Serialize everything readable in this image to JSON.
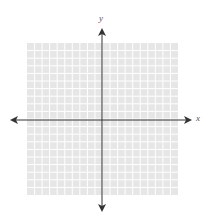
{
  "diagram": {
    "type": "coordinate-plane",
    "axes": {
      "x_label": "x",
      "y_label": "y",
      "arrows": "both-ends"
    },
    "grid": {
      "columns": 20,
      "rows": 20,
      "fill_color": "#e6e6e6",
      "line_color": "#ffffff"
    },
    "colors": {
      "axis": "#333333",
      "background": "#ffffff"
    }
  }
}
